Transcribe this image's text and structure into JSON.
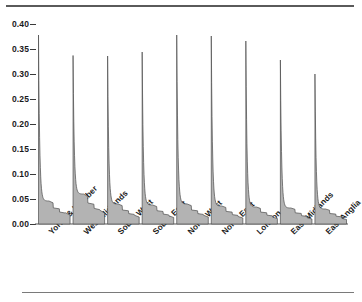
{
  "figure": {
    "top_rule": "horizontal-rule",
    "bottom_rule": "horizontal-rule"
  },
  "chart_data": {
    "type": "area",
    "title": "",
    "subtitle": "",
    "xlabel": "",
    "ylabel": "",
    "grid": false,
    "legend": "none",
    "ylim": [
      0.0,
      0.4
    ],
    "ytick_labels": [
      "0.40",
      "0.35",
      "0.30",
      "0.25",
      "0.20",
      "0.15",
      "0.10",
      "0.05",
      "0.00"
    ],
    "ytick_values": [
      0.4,
      0.35,
      0.3,
      0.25,
      0.2,
      0.15,
      0.1,
      0.05,
      0.0
    ],
    "categories": [
      "Yorks & Humber",
      "West Midlands",
      "South West",
      "South East",
      "North West",
      "North East",
      "London",
      "East Midlands",
      "East Anglia"
    ],
    "series": [
      {
        "name": "density-peak",
        "description": "peak height of each regional density spike",
        "values": [
          0.378,
          0.337,
          0.336,
          0.344,
          0.378,
          0.376,
          0.366,
          0.328,
          0.3
        ]
      },
      {
        "name": "tail-plateau",
        "description": "height of the long right-hand tail plateau at its shoulder",
        "values": [
          0.046,
          0.06,
          0.04,
          0.038,
          0.04,
          0.036,
          0.034,
          0.032,
          0.03
        ]
      },
      {
        "name": "tail-end",
        "description": "height of the density at the far right of each tail",
        "values": [
          0.018,
          0.022,
          0.014,
          0.013,
          0.014,
          0.012,
          0.011,
          0.01,
          0.009
        ]
      }
    ],
    "colors": {
      "fill": "#b3b3b3",
      "stroke": "#4d4d4d",
      "axis": "#555555",
      "text": "#1a1a1a"
    }
  }
}
